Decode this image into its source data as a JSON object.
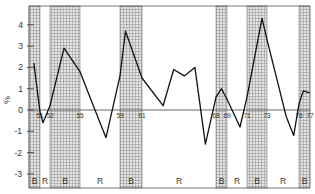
{
  "chart_data": {
    "type": "line",
    "title": "",
    "xlabel": "",
    "ylabel": "%",
    "ylim": [
      -3.7,
      4.9
    ],
    "yticks": [
      -3,
      -2,
      -1,
      0,
      1,
      2,
      3,
      4
    ],
    "grid": false,
    "legend": null,
    "band_labels": {
      "B": "shaded (boom/expansion)",
      "R": "unshaded (recession)"
    },
    "x_tick_labels": [
      "51",
      "52",
      "55",
      "59",
      "61",
      "68",
      "69",
      "71",
      "73",
      "76",
      "77"
    ],
    "periods": [
      {
        "label": "B",
        "shaded": true,
        "from": "49",
        "to": "51"
      },
      {
        "label": "R",
        "shaded": false,
        "from": "51",
        "to": "52"
      },
      {
        "label": "B",
        "shaded": true,
        "from": "52",
        "to": "55"
      },
      {
        "label": "R",
        "shaded": false,
        "from": "55",
        "to": "59"
      },
      {
        "label": "B",
        "shaded": true,
        "from": "59",
        "to": "61"
      },
      {
        "label": "R",
        "shaded": false,
        "from": "61",
        "to": "68"
      },
      {
        "label": "B",
        "shaded": true,
        "from": "68",
        "to": "69"
      },
      {
        "label": "R",
        "shaded": false,
        "from": "69",
        "to": "71"
      },
      {
        "label": "B",
        "shaded": true,
        "from": "71",
        "to": "73"
      },
      {
        "label": "R",
        "shaded": false,
        "from": "73",
        "to": "76"
      },
      {
        "label": "B",
        "shaded": true,
        "from": "76",
        "to": "77"
      }
    ],
    "series": [
      {
        "name": "rate",
        "points": [
          {
            "x": 49.9,
            "y": 2.2
          },
          {
            "x": 51.0,
            "y": -0.1
          },
          {
            "x": 51.3,
            "y": -0.6
          },
          {
            "x": 52.0,
            "y": 0.2
          },
          {
            "x": 53.4,
            "y": 2.9
          },
          {
            "x": 55.0,
            "y": 1.8
          },
          {
            "x": 56.5,
            "y": 0.0
          },
          {
            "x": 57.6,
            "y": -1.3
          },
          {
            "x": 59.0,
            "y": 1.6
          },
          {
            "x": 59.5,
            "y": 3.7
          },
          {
            "x": 61.0,
            "y": 1.5
          },
          {
            "x": 63.0,
            "y": 0.2
          },
          {
            "x": 64.0,
            "y": 1.9
          },
          {
            "x": 65.0,
            "y": 1.6
          },
          {
            "x": 66.0,
            "y": 2.0
          },
          {
            "x": 67.0,
            "y": -1.6
          },
          {
            "x": 68.0,
            "y": 0.6
          },
          {
            "x": 68.5,
            "y": 1.0
          },
          {
            "x": 69.0,
            "y": 0.5
          },
          {
            "x": 70.3,
            "y": -0.8
          },
          {
            "x": 71.0,
            "y": 0.6
          },
          {
            "x": 72.5,
            "y": 4.3
          },
          {
            "x": 73.0,
            "y": 3.3
          },
          {
            "x": 74.8,
            "y": -0.3
          },
          {
            "x": 75.5,
            "y": -1.2
          },
          {
            "x": 76.0,
            "y": 0.3
          },
          {
            "x": 76.4,
            "y": 0.9
          },
          {
            "x": 77.0,
            "y": 0.8
          }
        ]
      }
    ]
  }
}
